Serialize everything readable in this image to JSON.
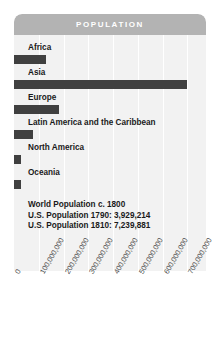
{
  "panel": {
    "header_title": "POPULATION"
  },
  "footnote": {
    "lines": [
      "World Population c. 1800",
      "U.S. Population 1790: 3,929,214",
      "U.S. Population 1810: 7,239,881"
    ]
  },
  "colors": {
    "bar": "#404040",
    "header": "#b3b3b3",
    "panel_background": "#f2f2f2",
    "gridline": "#ffffff",
    "text": "#1a1a1a",
    "tick_text": "#4d4d4d"
  },
  "chart_data": {
    "type": "bar",
    "orientation": "horizontal",
    "title": "POPULATION",
    "xlabel": "",
    "ylabel": "",
    "categories": [
      "Africa",
      "Asia",
      "Europe",
      "Latin America and the Caribbean",
      "North America",
      "Oceania"
    ],
    "values": [
      130000000,
      700000000,
      180000000,
      75000000,
      30000000,
      30000000
    ],
    "xlim": [
      0,
      775000000
    ],
    "ticks": [
      0,
      100000000,
      200000000,
      300000000,
      400000000,
      500000000,
      600000000,
      700000000
    ],
    "tick_labels": [
      "0",
      "100,000,000",
      "200,000,000",
      "300,000,000",
      "400,000,000",
      "500,000,000",
      "600,000,000",
      "700,000,000"
    ],
    "grid": true,
    "legend": "none",
    "annotations": [
      "World Population c. 1800",
      "U.S. Population 1790: 3,929,214",
      "U.S. Population 1810: 7,239,881"
    ]
  }
}
